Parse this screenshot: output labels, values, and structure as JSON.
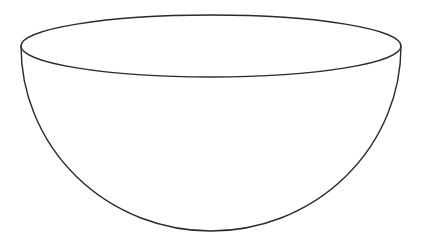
{
  "figure": {
    "width": 421,
    "height": 248,
    "background": "#ffffff",
    "stroke_color": "#2a2a2a",
    "stroke_width": 1.4,
    "rim": {
      "cx": 211,
      "cy": 46,
      "rx": 190,
      "ry": 31
    },
    "body": {
      "bottom_y": 231
    }
  }
}
